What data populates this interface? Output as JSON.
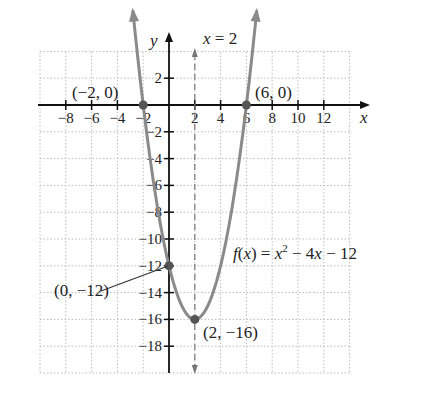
{
  "chart_data": {
    "type": "line",
    "title": "",
    "function": "f(x) = x^2 - 4x - 12",
    "xlabel": "x",
    "ylabel": "y",
    "xlim": [
      -10,
      14
    ],
    "ylim": [
      -20,
      4
    ],
    "grid": true,
    "x_ticks": [
      -8,
      -6,
      -4,
      -2,
      2,
      4,
      6,
      8,
      10,
      12
    ],
    "y_ticks": [
      2,
      -2,
      -4,
      -6,
      -8,
      -10,
      -12,
      -14,
      -16,
      -18
    ],
    "x_tick_labels": [
      "−8",
      "−6",
      "−4",
      "−2",
      "2",
      "4",
      "6",
      "8",
      "10",
      "12"
    ],
    "y_tick_labels": [
      "2",
      "−2",
      "−4",
      "−6",
      "−8",
      "−10",
      "−12",
      "−14",
      "−16",
      "−18"
    ],
    "series": [
      {
        "name": "f(x) = x² − 4x − 12",
        "x": [
          -2.8,
          -2,
          -1,
          0,
          1,
          2,
          3,
          4,
          5,
          6,
          6.8
        ],
        "y": [
          3.44,
          0,
          -7,
          -12,
          -15,
          -16,
          -15,
          -12,
          -7,
          0,
          3.44
        ],
        "color": "#8a8a8a"
      }
    ],
    "axis_of_symmetry": {
      "label": "x = 2",
      "x": 2,
      "style": "dashed"
    },
    "points": [
      {
        "label": "(−2, 0)",
        "x": -2,
        "y": 0
      },
      {
        "label": "(6, 0)",
        "x": 6,
        "y": 0
      },
      {
        "label": "(0, −12)",
        "x": 0,
        "y": -12
      },
      {
        "label": "(2, −16)",
        "x": 2,
        "y": -16
      }
    ],
    "annotations": {
      "function_label": "f(x) = x² − 4x − 12",
      "symmetry_label": "x = 2"
    }
  },
  "labels": {
    "y_axis": "y",
    "x_axis": "x",
    "symmetry_x": "x",
    "symmetry_eq": " = 2",
    "pt_neg2": "(−2, 0)",
    "pt_6": "(6, 0)",
    "pt_0": "(0, −12)",
    "pt_vertex": "(2, −16)",
    "fn_f": "f",
    "fn_rest1": "(",
    "fn_x1": "x",
    "fn_rest2": ") = ",
    "fn_x2": "x",
    "fn_sup": "2",
    "fn_rest3": " − 4",
    "fn_x3": "x",
    "fn_rest4": " − 12"
  }
}
